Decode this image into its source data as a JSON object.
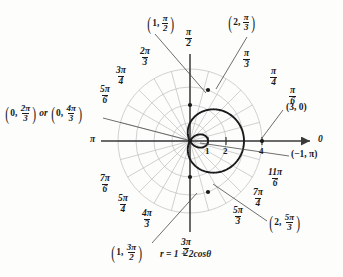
{
  "chart_data": {
    "type": "line",
    "subtype": "polar",
    "title": "",
    "equation": "r = 1 + 2cosθ",
    "equation_plain": "r = 1 + 2 cos(theta)",
    "curve_name": "limacon with inner loop",
    "polar_params": {
      "a": 1,
      "b": 2
    },
    "r_range": [
      -1,
      3
    ],
    "grid": true,
    "grid_circles": [
      1,
      2,
      3,
      4
    ],
    "radial_tick_labels": [
      "1",
      "2",
      "4"
    ],
    "radial_tick_values": [
      1,
      2,
      4
    ],
    "angle_spokes_count": 24,
    "axis_labels": {
      "right": "0",
      "left": "π",
      "top_num": "π",
      "top_den": "2",
      "bottom_num": "3π",
      "bottom_den": "2"
    },
    "angle_labels": [
      {
        "num": "π",
        "den": "6",
        "angle_deg": 30
      },
      {
        "num": "π",
        "den": "4",
        "angle_deg": 45
      },
      {
        "num": "π",
        "den": "3",
        "angle_deg": 60
      },
      {
        "num": "2π",
        "den": "3",
        "angle_deg": 120
      },
      {
        "num": "3π",
        "den": "4",
        "angle_deg": 135
      },
      {
        "num": "5π",
        "den": "6",
        "angle_deg": 150
      },
      {
        "num": "7π",
        "den": "6",
        "angle_deg": 210
      },
      {
        "num": "5π",
        "den": "4",
        "angle_deg": 225
      },
      {
        "num": "4π",
        "den": "3",
        "angle_deg": 240
      },
      {
        "num": "5π",
        "den": "3",
        "angle_deg": 300
      },
      {
        "num": "7π",
        "den": "4",
        "angle_deg": 315
      },
      {
        "num": "11π",
        "den": "6",
        "angle_deg": 330
      }
    ],
    "annotated_points": [
      {
        "label_r": "1",
        "label_num": "π",
        "label_den": "2",
        "r": 1,
        "theta_deg": 90
      },
      {
        "label_r": "2",
        "label_num": "π",
        "label_den": "3",
        "r": 2,
        "theta_deg": 60
      },
      {
        "label_plain": "(3, 0)",
        "r": 3,
        "theta_deg": 0
      },
      {
        "label_plain": "(−1, π)",
        "r": -1,
        "theta_deg": 180
      },
      {
        "label_r": "2",
        "label_num": "5π",
        "label_den": "3",
        "r": 2,
        "theta_deg": 300
      },
      {
        "label_r": "1",
        "label_num": "3π",
        "label_den": "2",
        "r": 1,
        "theta_deg": 270
      },
      {
        "label_r_a": "0",
        "label_num_a": "2π",
        "label_den_a": "3",
        "joiner": "or",
        "label_r_b": "0",
        "label_num_b": "4π",
        "label_den_b": "3",
        "r": 0,
        "theta_deg": 120
      }
    ],
    "colors": {
      "curve": "#1a1a1a",
      "grid": "#b9b9b9",
      "axis": "#3a3a3a",
      "text": "#1a1a1a",
      "background": "#fdfdfc"
    }
  },
  "labels": {
    "axis_right": "0",
    "axis_left": "π",
    "equation": "r = 1 + 2cosθ",
    "joiner": "or",
    "tick_1": "1",
    "tick_2": "2",
    "tick_4": "4",
    "pt_3_0": "(3, 0)",
    "pt_neg1_pi": "(−1, π)"
  }
}
